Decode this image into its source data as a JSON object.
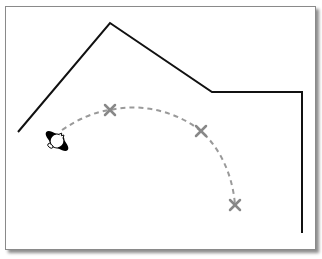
{
  "diagram": {
    "type": "floor-plan-path",
    "colors": {
      "frame_border": "#8a8a8a",
      "wall": "#111111",
      "path": "#9a9a9a",
      "marker": "#888888",
      "figure": "#000000"
    },
    "wall": {
      "points": [
        [
          18,
          132
        ],
        [
          110,
          23
        ],
        [
          212,
          92
        ],
        [
          302,
          92
        ],
        [
          302,
          233
        ]
      ]
    },
    "path": {
      "start": [
        62,
        130
      ],
      "waypoints": [
        [
          110,
          110
        ],
        [
          201,
          131
        ],
        [
          235,
          205
        ]
      ],
      "d": "M62,130 C80,118 95,112 110,110 C145,102 180,114 201,131 C222,150 233,178 235,205"
    },
    "markers": [
      {
        "label": "x",
        "x": 110,
        "y": 110
      },
      {
        "label": "x",
        "x": 201,
        "y": 131
      },
      {
        "label": "x",
        "x": 235,
        "y": 205
      }
    ],
    "figure": {
      "x": 57,
      "y": 141,
      "label": "person-top-view"
    }
  }
}
